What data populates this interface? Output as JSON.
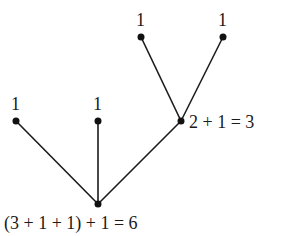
{
  "diagram": {
    "type": "tree",
    "nodes": [
      {
        "id": "leaf-a",
        "label": "1",
        "x": 141,
        "y": 37,
        "label_x": 136,
        "label_y": 26
      },
      {
        "id": "leaf-b",
        "label": "1",
        "x": 223,
        "y": 37,
        "label_x": 218,
        "label_y": 26
      },
      {
        "id": "leaf-c",
        "label": "1",
        "x": 16,
        "y": 121,
        "label_x": 11,
        "label_y": 110
      },
      {
        "id": "leaf-d",
        "label": "1",
        "x": 98,
        "y": 121,
        "label_x": 93,
        "label_y": 110
      },
      {
        "id": "mid",
        "label": "2 + 1 = 3",
        "x": 181,
        "y": 121,
        "label_x": 189,
        "label_y": 128
      },
      {
        "id": "root",
        "label": "(3 + 1 + 1) + 1 = 6",
        "x": 98,
        "y": 204,
        "label_x": 4,
        "label_y": 229
      }
    ],
    "edges": [
      {
        "from": "leaf-a",
        "to": "mid"
      },
      {
        "from": "leaf-b",
        "to": "mid"
      },
      {
        "from": "leaf-c",
        "to": "root"
      },
      {
        "from": "leaf-d",
        "to": "root"
      },
      {
        "from": "mid",
        "to": "root"
      }
    ]
  }
}
